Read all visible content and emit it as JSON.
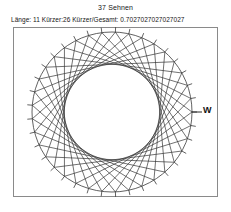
{
  "title": "37 Sehnen",
  "subtitle": "Länge: 11  Kürzer:26  Kürzer/Gesamt: 0.7027027027027027",
  "labels": {
    "w_point": "W"
  },
  "chart_data": {
    "type": "scatter",
    "title": "37 Sehnen",
    "subtitle": "Länge: 11  Kürzer:26  Kürzer/Gesamt: 0.7027027027027027",
    "xlabel": "",
    "ylabel": "",
    "grid": false,
    "legend": null,
    "annotations": [
      "W"
    ],
    "n_points": 37,
    "step_length": 11,
    "shorter_count": 26,
    "total_count": 37,
    "shorter_ratio": 0.7027027027027027,
    "circle": {
      "center_x": 112,
      "center_y": 112,
      "radius": 80,
      "tick_length": 5,
      "tick_count": 37
    },
    "anchor_point": {
      "label": "W",
      "index": 0,
      "angle_deg": 0,
      "x": 192,
      "y": 112
    },
    "chords": [
      {
        "from": 0,
        "to": 11
      },
      {
        "from": 11,
        "to": 22
      },
      {
        "from": 22,
        "to": 33
      },
      {
        "from": 33,
        "to": 7
      },
      {
        "from": 7,
        "to": 18
      },
      {
        "from": 18,
        "to": 29
      },
      {
        "from": 29,
        "to": 3
      },
      {
        "from": 3,
        "to": 14
      },
      {
        "from": 14,
        "to": 25
      },
      {
        "from": 25,
        "to": 36
      },
      {
        "from": 36,
        "to": 10
      },
      {
        "from": 10,
        "to": 21
      },
      {
        "from": 21,
        "to": 32
      },
      {
        "from": 32,
        "to": 6
      },
      {
        "from": 6,
        "to": 17
      },
      {
        "from": 17,
        "to": 28
      },
      {
        "from": 28,
        "to": 2
      },
      {
        "from": 2,
        "to": 13
      },
      {
        "from": 13,
        "to": 24
      },
      {
        "from": 24,
        "to": 35
      },
      {
        "from": 35,
        "to": 9
      },
      {
        "from": 9,
        "to": 20
      },
      {
        "from": 20,
        "to": 31
      },
      {
        "from": 31,
        "to": 5
      },
      {
        "from": 5,
        "to": 16
      },
      {
        "from": 16,
        "to": 27
      },
      {
        "from": 27,
        "to": 1
      },
      {
        "from": 1,
        "to": 12
      },
      {
        "from": 12,
        "to": 23
      },
      {
        "from": 23,
        "to": 34
      },
      {
        "from": 34,
        "to": 8
      },
      {
        "from": 8,
        "to": 19
      },
      {
        "from": 19,
        "to": 30
      },
      {
        "from": 30,
        "to": 4
      },
      {
        "from": 4,
        "to": 15
      },
      {
        "from": 15,
        "to": 26
      },
      {
        "from": 26,
        "to": 0
      }
    ],
    "frame": {
      "x": 13,
      "y": 27,
      "width": 205,
      "height": 170
    },
    "colors": {
      "stroke": "#333333",
      "frame": "#8a8a8a",
      "background": "#ffffff"
    }
  }
}
